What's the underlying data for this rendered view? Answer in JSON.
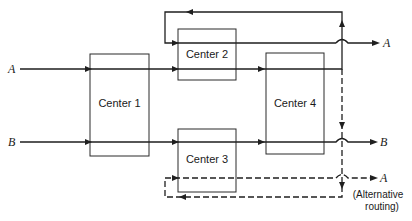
{
  "diagram": {
    "type": "flow",
    "inputs": [
      {
        "id": "A",
        "label": "A"
      },
      {
        "id": "B",
        "label": "B"
      }
    ],
    "centers": [
      {
        "id": "c1",
        "label": "Center 1"
      },
      {
        "id": "c2",
        "label": "Center 2"
      },
      {
        "id": "c3",
        "label": "Center 3"
      },
      {
        "id": "c4",
        "label": "Center 4"
      }
    ],
    "outputs": [
      {
        "id": "outA",
        "label": "A"
      },
      {
        "id": "outB",
        "label": "B"
      },
      {
        "id": "outAalt",
        "label": "A",
        "note_line1": "(Alternative",
        "note_line2": "routing)"
      }
    ],
    "routes": [
      {
        "product": "A",
        "path": [
          "Center 1",
          "Center 2",
          "Center 4",
          "Center 2"
        ],
        "style": "solid"
      },
      {
        "product": "B",
        "path": [
          "Center 1",
          "Center 3",
          "Center 4"
        ],
        "style": "solid"
      },
      {
        "product": "A",
        "path": [
          "Center 1",
          "Center 2",
          "Center 4",
          "Center 3"
        ],
        "style": "dashed",
        "note": "Alternative routing"
      }
    ]
  }
}
